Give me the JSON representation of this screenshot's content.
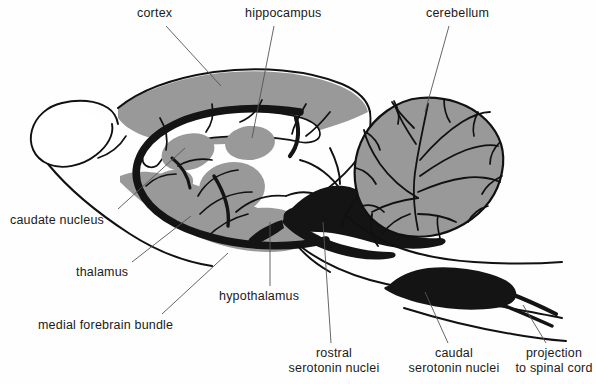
{
  "figure": {
    "background_color": "#fefefe",
    "ink_color": "#111111",
    "gray_fill": "#999999",
    "black_fill": "#141414",
    "leader_color": "#555555"
  },
  "labels": [
    {
      "id": "cortex",
      "text": "cortex",
      "x": 137,
      "y": 6,
      "align": "left",
      "leader": {
        "x1": 166,
        "y1": 26,
        "x2": 221,
        "y2": 86
      }
    },
    {
      "id": "hippocampus",
      "text": "hippocampus",
      "x": 245,
      "y": 6,
      "align": "left",
      "leader": {
        "x1": 274,
        "y1": 26,
        "x2": 252,
        "y2": 138
      }
    },
    {
      "id": "cerebellum",
      "text": "cerebellum",
      "x": 426,
      "y": 6,
      "align": "left",
      "leader": {
        "x1": 449,
        "y1": 26,
        "x2": 425,
        "y2": 112
      }
    },
    {
      "id": "caudate-nucleus",
      "text": "caudate nucleus",
      "x": 10,
      "y": 213,
      "align": "left",
      "leader": {
        "x1": 118,
        "y1": 209,
        "x2": 185,
        "y2": 148
      }
    },
    {
      "id": "thalamus",
      "text": "thalamus",
      "x": 76,
      "y": 265,
      "align": "left",
      "leader": {
        "x1": 132,
        "y1": 262,
        "x2": 191,
        "y2": 216
      }
    },
    {
      "id": "medial-forebrain-bundle",
      "text": "medial forebrain bundle",
      "x": 38,
      "y": 318,
      "align": "left",
      "leader": {
        "x1": 162,
        "y1": 314,
        "x2": 228,
        "y2": 253
      }
    },
    {
      "id": "hypothalamus",
      "text": "hypothalamus",
      "x": 219,
      "y": 289,
      "align": "left",
      "leader": {
        "x1": 270,
        "y1": 286,
        "x2": 270,
        "y2": 222
      }
    },
    {
      "id": "rostral-serotonin-nuclei",
      "text": "rostral\nserotonin nuclei",
      "x": 279,
      "y": 346,
      "align": "center",
      "width": 110,
      "leader": {
        "x1": 331,
        "y1": 343,
        "x2": 323,
        "y2": 222
      }
    },
    {
      "id": "caudal-serotonin-nuclei",
      "text": "caudal\nserotonin nuclei",
      "x": 398,
      "y": 346,
      "align": "center",
      "width": 112,
      "leader": {
        "x1": 448,
        "y1": 343,
        "x2": 425,
        "y2": 292
      }
    },
    {
      "id": "projection-to-spinal-cord",
      "text": "projection\nto spinal cord",
      "x": 512,
      "y": 346,
      "align": "center",
      "width": 84,
      "leader": {
        "x1": 546,
        "y1": 343,
        "x2": 523,
        "y2": 305
      }
    }
  ],
  "structures": [
    {
      "id": "olfactory-bulb",
      "name": "olfactory bulb",
      "fill": "white"
    },
    {
      "id": "cerebral-cortex",
      "name": "cerebral cortex",
      "fill": "gray"
    },
    {
      "id": "corpus-callosum",
      "name": "corpus callosum",
      "fill": "white"
    },
    {
      "id": "hippocampus-body",
      "name": "hippocampus",
      "fill": "gray"
    },
    {
      "id": "caudate-nucleus-body",
      "name": "caudate nucleus",
      "fill": "gray"
    },
    {
      "id": "thalamus-body",
      "name": "thalamus",
      "fill": "gray"
    },
    {
      "id": "hypothalamus-body",
      "name": "hypothalamus",
      "fill": "gray"
    },
    {
      "id": "medial-forebrain-bundle-tract",
      "name": "medial forebrain bundle",
      "fill": "black"
    },
    {
      "id": "rostral-serotonin-nuclei-body",
      "name": "rostral serotonin nuclei",
      "fill": "black"
    },
    {
      "id": "caudal-serotonin-nuclei-body",
      "name": "caudal serotonin nuclei",
      "fill": "black"
    },
    {
      "id": "cerebellum-body",
      "name": "cerebellum",
      "fill": "gray"
    },
    {
      "id": "brainstem",
      "name": "brainstem",
      "fill": "white"
    },
    {
      "id": "spinal-cord-projection",
      "name": "spinal cord projection",
      "fill": "black"
    }
  ]
}
